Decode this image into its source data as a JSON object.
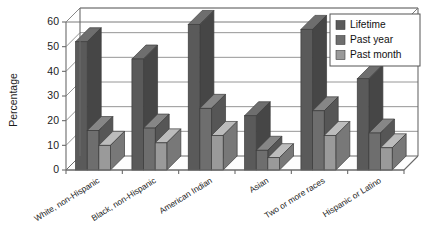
{
  "chart_data": {
    "type": "bar",
    "title": "",
    "subtitle": "",
    "xlabel": "",
    "ylabel": "Percentage",
    "ylim": [
      0,
      60
    ],
    "yticks": [
      0,
      10,
      20,
      30,
      40,
      50,
      60
    ],
    "ytick_labels": [
      "0",
      "10",
      "20",
      "30",
      "40",
      "50",
      "60"
    ],
    "grid": true,
    "grid_axis": "y",
    "legend_position": "top-right",
    "style": "3d-clustered-column",
    "categories": [
      "White, non-Hispanic",
      "Black, non-Hispanic",
      "American Indian",
      "Asian",
      "Two or more races",
      "Hispanic or Latino"
    ],
    "series": [
      {
        "name": "Lifetime",
        "color": "#5a5a5a",
        "values": [
          52,
          45,
          59,
          22,
          57,
          37
        ]
      },
      {
        "name": "Past year",
        "color": "#6e6e6e",
        "values": [
          16,
          17,
          25,
          8,
          24,
          15
        ]
      },
      {
        "name": "Past month",
        "color": "#9a9a9a",
        "values": [
          10,
          11,
          14,
          5,
          14,
          9
        ]
      }
    ]
  },
  "legend": {
    "entries": [
      {
        "label": "Lifetime"
      },
      {
        "label": "Past year"
      },
      {
        "label": "Past month"
      }
    ]
  },
  "axes": {
    "y_title": "Percentage"
  }
}
